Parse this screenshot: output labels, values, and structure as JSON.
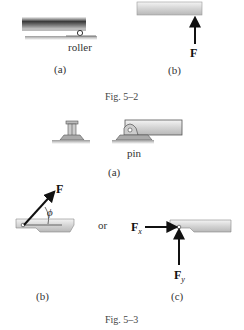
{
  "fig_5_2": {
    "caption": "Fig. 5–2",
    "panel_a": {
      "label": "(a)",
      "support_label": "roller"
    },
    "panel_b": {
      "label": "(b)",
      "force_label": "F"
    }
  },
  "fig_5_3": {
    "caption": "Fig. 5–3",
    "panel_a": {
      "label": "(a)",
      "support_label": "pin"
    },
    "panel_b": {
      "label": "(b)",
      "force_label": "F",
      "angle_label": "ϕ"
    },
    "connector": "or",
    "panel_c": {
      "label": "(c)",
      "fx_label": "F",
      "fx_sub": "x",
      "fy_label": "F",
      "fy_sub": "y"
    }
  },
  "colors": {
    "beam_light": "#e6e6e6",
    "beam_mid": "#bdbdbd",
    "beam_dark": "#5a5a5a",
    "arrow": "#111111",
    "ground": "#8a8a8a"
  }
}
